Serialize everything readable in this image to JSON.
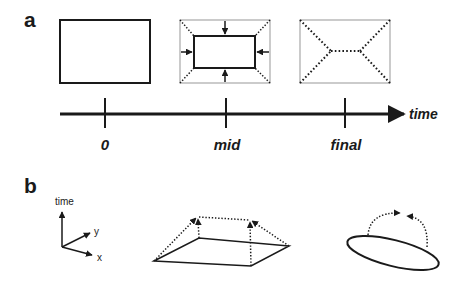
{
  "panels": {
    "a": {
      "label": "a",
      "timeline": {
        "axis_label": "time",
        "ticks": [
          {
            "label": "0"
          },
          {
            "label": "mid"
          },
          {
            "label": "final"
          }
        ]
      },
      "stages": [
        {
          "name": "initial-rectangle",
          "description": "Solid rectangle at time 0"
        },
        {
          "name": "mid-shrinking-rectangle",
          "description": "Rectangle shrinking inward, arrows pointing in from each side"
        },
        {
          "name": "final-skeleton",
          "description": "Dotted straight skeleton inside faint outline"
        }
      ]
    },
    "b": {
      "label": "b",
      "axes": {
        "vertical": "time",
        "y": "y",
        "x": "x"
      },
      "shapes": [
        {
          "name": "roof-surface",
          "description": "Rectangle base lifted over time to a ridge (dotted arrows)"
        },
        {
          "name": "ellipse-ridge",
          "description": "Ellipse with dotted arcs converging upward"
        }
      ]
    }
  },
  "colors": {
    "ink": "#1a1a1a",
    "faint_outline": "#a8a8a8",
    "background": "#ffffff"
  }
}
